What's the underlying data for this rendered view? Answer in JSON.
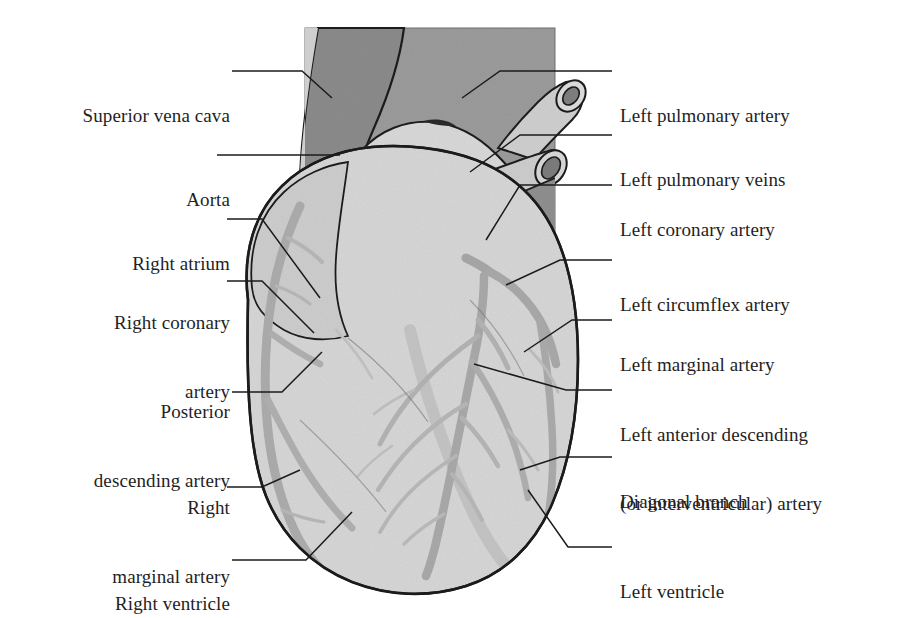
{
  "figure": {
    "background_color": "#ffffff"
  },
  "palette": {
    "outline": "#1b1b1b",
    "body_light": "#d6d6d6",
    "body_mid": "#c3c3c3",
    "vessel_gray": "#a9a9a9",
    "dark_gray": "#8b8b8b",
    "mid_dark_gray": "#9a9a9a",
    "pale": "#e2e2e2",
    "label_color": "#1f1f1f",
    "leader_color": "#1b1b1b"
  },
  "labels_left": [
    {
      "id": "superior-vena-cava",
      "lines": [
        "Superior vena cava"
      ],
      "x": 30,
      "y": 58,
      "width": 200
    },
    {
      "id": "aorta",
      "lines": [
        "Aorta"
      ],
      "x": 30,
      "y": 142,
      "width": 200
    },
    {
      "id": "right-atrium",
      "lines": [
        "Right atrium"
      ],
      "x": 30,
      "y": 206,
      "width": 200
    },
    {
      "id": "right-coronary-artery",
      "lines": [
        "Right coronary",
        "artery"
      ],
      "x": 30,
      "y": 265,
      "width": 200
    },
    {
      "id": "posterior-descending-artery",
      "lines": [
        "Posterior",
        "descending artery"
      ],
      "x": 30,
      "y": 354,
      "width": 200
    },
    {
      "id": "right-marginal-artery",
      "lines": [
        "Right",
        "marginal artery"
      ],
      "x": 30,
      "y": 450,
      "width": 200
    },
    {
      "id": "right-ventricle",
      "lines": [
        "Right ventricle"
      ],
      "x": 30,
      "y": 546,
      "width": 200
    }
  ],
  "labels_right": [
    {
      "id": "left-pulmonary-artery",
      "lines": [
        "Left pulmonary artery"
      ],
      "x": 620,
      "y": 58
    },
    {
      "id": "left-pulmonary-veins",
      "lines": [
        "Left pulmonary veins"
      ],
      "x": 620,
      "y": 122
    },
    {
      "id": "left-coronary-artery",
      "lines": [
        "Left coronary artery"
      ],
      "x": 620,
      "y": 172
    },
    {
      "id": "left-circumflex-artery",
      "lines": [
        "Left circumflex artery"
      ],
      "x": 620,
      "y": 247
    },
    {
      "id": "left-marginal-artery",
      "lines": [
        "Left marginal artery"
      ],
      "x": 620,
      "y": 307
    },
    {
      "id": "left-anterior-descending-artery",
      "lines": [
        "Left anterior descending",
        "(or interventricular) artery"
      ],
      "x": 620,
      "y": 377
    },
    {
      "id": "diagonal-branch",
      "lines": [
        "Diagonal branch"
      ],
      "x": 620,
      "y": 444
    },
    {
      "id": "left-ventricle",
      "lines": [
        "Left ventricle"
      ],
      "x": 620,
      "y": 534
    }
  ]
}
